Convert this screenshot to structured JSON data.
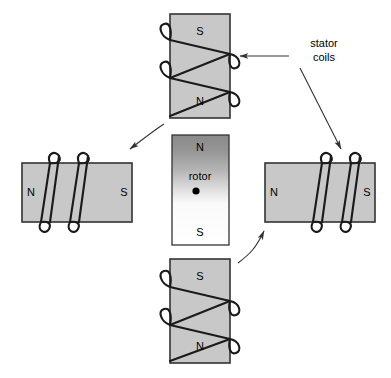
{
  "diagram": {
    "background_color": "#ffffff",
    "magnet_fill": "#c8c8c8",
    "magnet_stroke": "#333333",
    "coil_color": "#1a1a1a",
    "arrow_color": "#333333",
    "rotor_fill_top": "#8a8a8a",
    "rotor_fill_bottom": "#ffffff"
  },
  "callout": {
    "line1": "stator",
    "line2": "coils"
  },
  "stators": {
    "top": {
      "name": "top-stator-magnet",
      "pole_top": "S",
      "pole_bottom": "N",
      "orientation": "vertical"
    },
    "bottom": {
      "name": "bottom-stator-magnet",
      "pole_top": "S",
      "pole_bottom": "N",
      "orientation": "vertical"
    },
    "left": {
      "name": "left-stator-magnet",
      "pole_left": "N",
      "pole_right": "S",
      "orientation": "horizontal"
    },
    "right": {
      "name": "right-stator-magnet",
      "pole_left": "N",
      "pole_right": "S",
      "orientation": "horizontal"
    }
  },
  "rotor": {
    "name": "rotor",
    "label": "rotor",
    "pole_top": "N",
    "pole_bottom": "S"
  }
}
